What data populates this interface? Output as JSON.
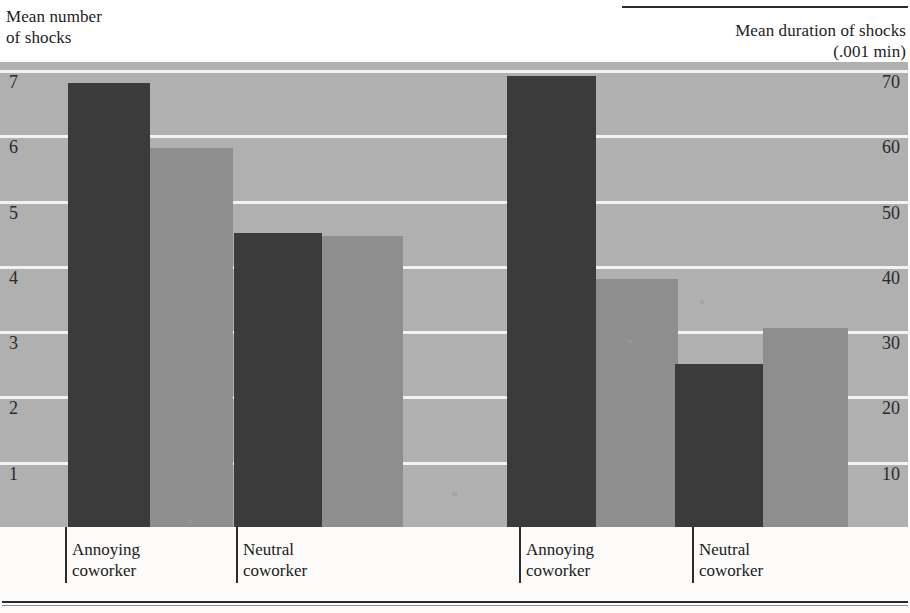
{
  "axis_captions": {
    "left": "Mean number\nof shocks",
    "right": "Mean duration of shocks\n(.001 min)"
  },
  "left_ticks": [
    "7",
    "6",
    "5",
    "4",
    "3",
    "2",
    "1"
  ],
  "right_ticks": [
    "70",
    "60",
    "50",
    "40",
    "30",
    "20",
    "10"
  ],
  "group_labels": [
    "Annoying\ncoworker",
    "Neutral\ncoworker",
    "Annoying\ncoworker",
    "Neutral\ncoworker"
  ],
  "colors": {
    "dark_bar": "#3b3b3b",
    "light_bar": "#8e8e8e",
    "plot_background": "#b0b0b0",
    "gridline": "#f2f2f2",
    "rule": "#2b2b2b",
    "page_background": "#ffffff"
  },
  "chart_data": {
    "type": "bar",
    "title": "",
    "panels": [
      {
        "name": "Mean number of shocks",
        "ylabel": "Mean number\nof shocks",
        "ylim": [
          0,
          7.6
        ],
        "yticks": [
          1,
          2,
          3,
          4,
          5,
          6,
          7
        ],
        "categories": [
          "Annoying coworker",
          "Neutral coworker"
        ],
        "series": [
          {
            "name": "dark",
            "values": [
              6.8,
              4.5
            ]
          },
          {
            "name": "light",
            "values": [
              5.8,
              4.45
            ]
          }
        ]
      },
      {
        "name": "Mean duration of shocks",
        "ylabel": "Mean duration of shocks\n(.001 min)",
        "ylim": [
          0,
          76
        ],
        "yticks": [
          10,
          20,
          30,
          40,
          50,
          60,
          70
        ],
        "categories": [
          "Annoying coworker",
          "Neutral coworker"
        ],
        "series": [
          {
            "name": "dark",
            "values": [
              69,
              25
            ]
          },
          {
            "name": "light",
            "values": [
              38,
              30.5
            ]
          }
        ]
      }
    ],
    "bars": [
      {
        "panel": 0,
        "category": "Annoying coworker",
        "series": "dark",
        "value": 6.8,
        "x": 68,
        "width": 82,
        "unit": "shocks"
      },
      {
        "panel": 0,
        "category": "Annoying coworker",
        "series": "light",
        "value": 5.8,
        "x": 150,
        "width": 83,
        "unit": "shocks"
      },
      {
        "panel": 0,
        "category": "Neutral coworker",
        "series": "dark",
        "value": 4.5,
        "x": 234,
        "width": 88,
        "unit": "shocks"
      },
      {
        "panel": 0,
        "category": "Neutral coworker",
        "series": "light",
        "value": 4.45,
        "x": 322,
        "width": 81,
        "unit": "shocks"
      },
      {
        "panel": 1,
        "category": "Annoying coworker",
        "series": "dark",
        "value": 69,
        "x": 507,
        "width": 89,
        "unit": ".001 min"
      },
      {
        "panel": 1,
        "category": "Annoying coworker",
        "series": "light",
        "value": 38,
        "x": 596,
        "width": 82,
        "unit": ".001 min"
      },
      {
        "panel": 1,
        "category": "Neutral coworker",
        "series": "dark",
        "value": 25,
        "x": 675,
        "width": 88,
        "unit": ".001 min"
      },
      {
        "panel": 1,
        "category": "Neutral coworker",
        "series": "light",
        "value": 30.5,
        "x": 763,
        "width": 85,
        "unit": ".001 min"
      }
    ],
    "gridlines_y_values": [
      7,
      6,
      5,
      4,
      3,
      2,
      1
    ],
    "grid": true,
    "legend": "none",
    "xlabel": ""
  },
  "geometry": {
    "plot_top": 62,
    "plot_height": 465,
    "baseline_y": 527,
    "px_per_left_unit": 65.3,
    "px_per_right_unit": 6.53,
    "xticks_x": [
      65,
      236,
      519,
      692
    ],
    "xlabels_x": [
      72,
      243,
      526,
      699
    ]
  }
}
